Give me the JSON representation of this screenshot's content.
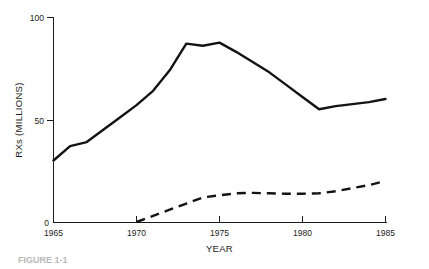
{
  "chart_data": {
    "type": "line",
    "title": "",
    "xlabel": "YEAR",
    "ylabel": "RXs (MILLIONS)",
    "xlim": [
      1965,
      1985
    ],
    "ylim": [
      0,
      100
    ],
    "xticks": [
      1965,
      1970,
      1975,
      1980,
      1985
    ],
    "xtick_labels": [
      "1965",
      "1970",
      "1975",
      "1980",
      "1985"
    ],
    "yticks": [
      0,
      50,
      100
    ],
    "ytick_labels": [
      "0",
      "50",
      "100"
    ],
    "grid": false,
    "legend": "none",
    "series": [
      {
        "name": "solid-series",
        "style": "solid",
        "x": [
          1965,
          1966,
          1967,
          1968,
          1969,
          1970,
          1971,
          1972,
          1973,
          1974,
          1975,
          1976,
          1977,
          1978,
          1979,
          1980,
          1981,
          1982,
          1983,
          1984,
          1985
        ],
        "values": [
          30,
          37,
          39,
          45,
          51,
          57,
          64,
          74,
          87,
          86,
          87.5,
          83,
          78,
          73,
          67,
          61,
          55,
          56.5,
          57.5,
          58.5,
          60
        ]
      },
      {
        "name": "dashed-series",
        "style": "dashed",
        "x": [
          1970,
          1971,
          1972,
          1973,
          1974,
          1975,
          1976,
          1977,
          1978,
          1979,
          1980,
          1981,
          1982,
          1983,
          1984,
          1985
        ],
        "values": [
          0,
          3,
          6,
          9,
          12,
          13,
          14,
          14.2,
          14,
          13.8,
          13.8,
          14,
          15,
          16.5,
          18,
          20
        ]
      }
    ]
  },
  "axes": {
    "y_label": "RXs (MILLIONS)",
    "x_label": "YEAR",
    "y_tick_top": "100",
    "y_tick_mid": "50",
    "y_tick_bottom": "0",
    "x_tick_1": "1965",
    "x_tick_2": "1970",
    "x_tick_3": "1975",
    "x_tick_4": "1980",
    "x_tick_5": "1985"
  },
  "caption": {
    "text": "FIGURE 1-1"
  },
  "colors": {
    "ink": "#131313",
    "axis": "#1c1c1c",
    "background": "#ffffff"
  }
}
